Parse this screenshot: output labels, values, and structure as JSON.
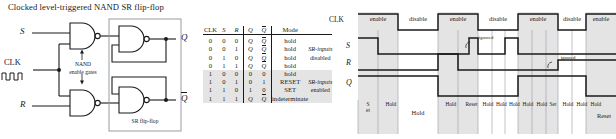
{
  "title": "Clocked level-triggered NAND SR flip-flop",
  "logic_diagram": {
    "inputs": [
      {
        "name": "input-s",
        "label": "S"
      },
      {
        "name": "input-clk",
        "label": "CLK"
      },
      {
        "name": "input-r",
        "label": "R"
      }
    ],
    "outputs": [
      {
        "name": "output-q",
        "label": "Q"
      },
      {
        "name": "output-qbar",
        "label": "Q"
      }
    ],
    "annotations": {
      "enable_gates_line1": "NAND",
      "enable_gates_line2": "enable gates",
      "flipflop_box": "SR flip-flop"
    }
  },
  "truth_table": {
    "headers": [
      "CLK",
      "S",
      "R",
      "Q",
      "Q",
      "Mode"
    ],
    "rows": [
      {
        "clk": "0",
        "s": "0",
        "r": "0",
        "q": "Q",
        "qb": "Q",
        "mode": "hold",
        "note": "",
        "shaded": false
      },
      {
        "clk": "0",
        "s": "0",
        "r": "1",
        "q": "Q",
        "qb": "Q",
        "mode": "hold",
        "note": "SR-inputs",
        "shaded": false
      },
      {
        "clk": "0",
        "s": "1",
        "r": "0",
        "q": "Q",
        "qb": "Q",
        "mode": "hold",
        "note": "disabled",
        "shaded": false
      },
      {
        "clk": "0",
        "s": "1",
        "r": "1",
        "q": "Q",
        "qb": "Q",
        "mode": "hold",
        "note": "",
        "shaded": false
      },
      {
        "clk": "1",
        "s": "0",
        "r": "0",
        "q": "0",
        "qb": "0",
        "mode": "hold",
        "note": "",
        "shaded": true
      },
      {
        "clk": "1",
        "s": "0",
        "r": "1",
        "q": "0",
        "qb": "1",
        "mode": "RESET",
        "note": "SR-inputs",
        "shaded": true
      },
      {
        "clk": "1",
        "s": "1",
        "r": "0",
        "q": "1",
        "qb": "0",
        "mode": "SET",
        "note": "enabled",
        "shaded": true
      },
      {
        "clk": "1",
        "s": "1",
        "r": "1",
        "q": "Q",
        "qb": "Q",
        "mode": "indeterminate",
        "note": "",
        "shaded": true
      }
    ]
  },
  "timing_diagram": {
    "signals": [
      {
        "name": "signal-clk",
        "label": "CLK"
      },
      {
        "name": "signal-s",
        "label": "S"
      },
      {
        "name": "signal-r",
        "label": "R"
      },
      {
        "name": "signal-q",
        "label": "Q"
      }
    ],
    "clk_phases": [
      "enable",
      "disable",
      "enable",
      "disable",
      "enable",
      "disable",
      "enable"
    ],
    "mode_labels": [
      "Set",
      "Hold",
      "Hold",
      "Hold",
      "Reset",
      "Hold",
      "Hold",
      "Hold",
      "Hold",
      "Hold",
      "Set",
      "Hold",
      "Hold",
      "Hold",
      "Reset"
    ],
    "annotations": [
      {
        "name": "ignored-annotation-1",
        "text": "ignored"
      },
      {
        "name": "ignored-annotation-2",
        "text": "ignored"
      }
    ]
  },
  "colors": {
    "ink": "#1a1a1a",
    "shade": "#e4e4e4",
    "grid": "#9a9aa8"
  }
}
